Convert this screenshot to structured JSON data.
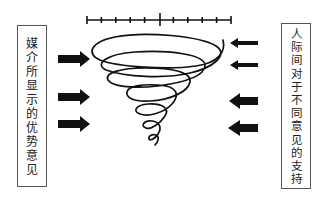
{
  "diagram": {
    "left_label": {
      "text": "媒介所显示的优势意见",
      "chars": [
        "媒",
        "介",
        "所",
        "显",
        "示",
        "的",
        "优",
        "势",
        "意",
        "见"
      ]
    },
    "right_label": {
      "text": "人际间对于不同意见的支持",
      "chars": [
        "人",
        "际",
        "间",
        "对",
        "于",
        "不",
        "同",
        "意",
        "见",
        "的",
        "支",
        "持"
      ]
    },
    "scale_bar": {
      "tick_count": 11,
      "center_tick_emphasized": true
    },
    "left_arrows": {
      "count": 3,
      "direction": "right"
    },
    "right_arrows": {
      "count": 4,
      "direction": "left"
    },
    "center": {
      "shape": "downward-narrowing spiral"
    },
    "colors": {
      "ink": "#111111",
      "box_border": "#555555",
      "background": "#ffffff"
    }
  }
}
